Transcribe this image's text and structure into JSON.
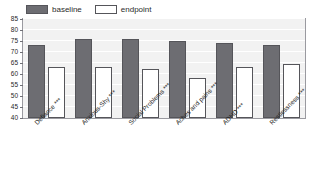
{
  "chart_data": {
    "type": "bar",
    "title": "",
    "xlabel": "",
    "ylabel": "",
    "ylim": [
      40,
      85
    ],
    "yticks": [
      40,
      45,
      50,
      55,
      60,
      65,
      70,
      75,
      80,
      85
    ],
    "ytick_labels": [
      "40",
      "45",
      "50",
      "55",
      "60",
      "65",
      "70",
      "75",
      "80",
      "85"
    ],
    "grid": true,
    "legend_position": "top-left",
    "categories": [
      "Defiance ***",
      "Anxious-Shy ***",
      "Social Problems ***",
      "Aches and pains ***",
      "ADHD ***",
      "Restlessness ***"
    ],
    "series": [
      {
        "name": "baseline",
        "color": "#6d6d72",
        "values": [
          73,
          76,
          76,
          75,
          74,
          73
        ]
      },
      {
        "name": "endpoint",
        "color": "#ffffff",
        "values": [
          63,
          63,
          62.5,
          58,
          63,
          64.5
        ]
      }
    ]
  },
  "legend": {
    "entries": [
      {
        "label": "baseline",
        "swatch": "baseline"
      },
      {
        "label": "endpoint",
        "swatch": "endpoint"
      }
    ]
  }
}
